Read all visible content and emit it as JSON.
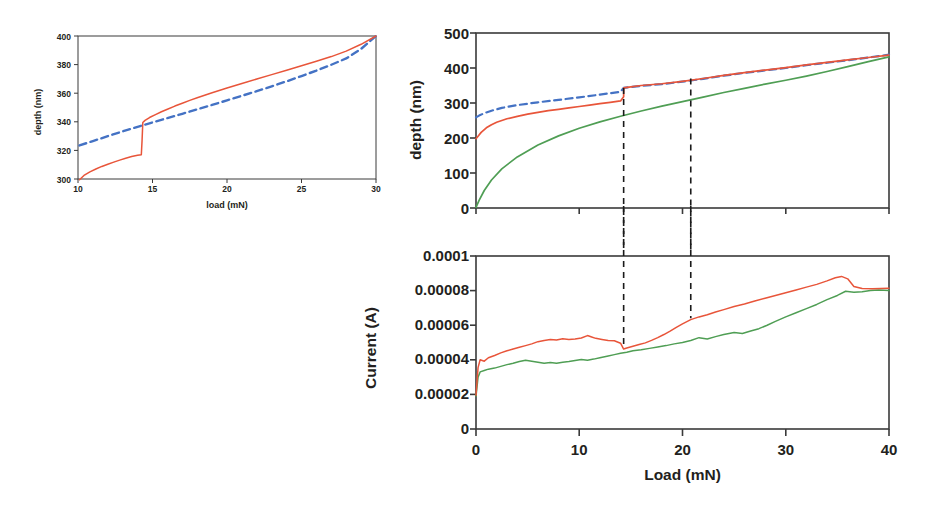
{
  "figure": {
    "title": "",
    "background": "#ffffff",
    "colors": {
      "red": "#e8553a",
      "green": "#4f9e54",
      "blue_dashed": "#4472c4",
      "axis": "#3a3a3a",
      "guide": "#1a1a1a",
      "text": "#231f20"
    }
  },
  "panels": {
    "left": {
      "name": "pop-in-detail",
      "xlabel": "load (mN)",
      "ylabel": "depth (nm)",
      "xticks": [
        "10",
        "15",
        "20",
        "25",
        "30"
      ],
      "yticks": [
        "300",
        "320",
        "340",
        "360",
        "380",
        "400"
      ]
    },
    "top_right": {
      "name": "depth-vs-load",
      "xlabel": "",
      "ylabel": "depth (nm)",
      "xticks": [
        "0",
        "10",
        "20",
        "30",
        "40"
      ],
      "yticks": [
        "0",
        "100",
        "200",
        "300",
        "400",
        "500"
      ]
    },
    "bottom_right": {
      "name": "current-vs-load",
      "xlabel": "Load (mN)",
      "ylabel": "Current (A)",
      "xticks": [
        "0",
        "10",
        "20",
        "30",
        "40"
      ],
      "yticks": [
        "0",
        "0.00002",
        "0.00004",
        "0.00006",
        "0.00008",
        "0.0001"
      ]
    }
  },
  "chart_data": [
    {
      "id": "left-panel",
      "type": "line",
      "title": "",
      "xlabel": "load (mN)",
      "ylabel": "depth (nm)",
      "xlim": [
        10,
        30
      ],
      "ylim": [
        300,
        400
      ],
      "xticks": [
        10,
        15,
        20,
        25,
        30
      ],
      "yticks": [
        300,
        320,
        340,
        360,
        380,
        400
      ],
      "grid": false,
      "legend": "none",
      "annotations": [
        "pop-in step at load 14.3 mN, depth jumps 317 to 340 nm"
      ],
      "series": [
        {
          "name": "loading curve (measured)",
          "color": "#e8553a",
          "style": "solid",
          "x": [
            10.1,
            10.4,
            10.8,
            11.2,
            11.6,
            12.0,
            12.4,
            12.8,
            13.2,
            13.6,
            14.0,
            14.25,
            14.3,
            14.35,
            14.5,
            14.8,
            15.2,
            15.6,
            16.0,
            16.5,
            17.0,
            17.5,
            18.0,
            18.5,
            19.0,
            20.0,
            21.0,
            22.0,
            23.0,
            24.0,
            25.0,
            26.0,
            27.0,
            28.0,
            29.0,
            30.0
          ],
          "y": [
            299.5,
            302.5,
            305.0,
            307.0,
            308.8,
            310.3,
            311.8,
            313.2,
            314.5,
            315.7,
            316.6,
            317.0,
            327.0,
            339.5,
            341.0,
            343.0,
            345.0,
            347.0,
            348.8,
            351.0,
            353.0,
            355.0,
            356.8,
            358.6,
            360.3,
            363.6,
            366.8,
            369.9,
            373.0,
            376.1,
            379.2,
            382.4,
            385.6,
            389.4,
            394.2,
            400.0
          ]
        },
        {
          "name": "reference/fit curve",
          "color": "#4472c4",
          "style": "dashed",
          "x": [
            10.1,
            11.0,
            12.0,
            13.0,
            14.0,
            15.0,
            16.0,
            17.0,
            18.0,
            19.0,
            20.0,
            21.0,
            22.0,
            23.0,
            24.0,
            25.0,
            26.0,
            27.0,
            28.0,
            29.0,
            30.0
          ],
          "y": [
            323.5,
            326.5,
            330.0,
            333.3,
            336.5,
            339.6,
            342.6,
            345.6,
            348.7,
            351.8,
            355.0,
            358.2,
            361.4,
            364.8,
            368.3,
            372.0,
            375.8,
            379.9,
            384.3,
            391.0,
            400.0
          ]
        }
      ]
    },
    {
      "id": "top-right-panel",
      "type": "line",
      "title": "",
      "xlabel": "",
      "ylabel": "depth (nm)",
      "xlim": [
        0,
        40
      ],
      "ylim": [
        0,
        500
      ],
      "xticks": [
        0,
        10,
        20,
        30,
        40
      ],
      "yticks": [
        0,
        100,
        200,
        300,
        400,
        500
      ],
      "grid": false,
      "legend": "none",
      "annotations": [
        "vertical dashed guide at 14.3 mN",
        "vertical dashed guide at 20.8 mN"
      ],
      "guides_x": [
        14.3,
        20.8
      ],
      "series": [
        {
          "name": "depth red (with pop-in)",
          "color": "#e8553a",
          "style": "solid",
          "x": [
            0.0,
            0.2,
            0.5,
            1.0,
            1.5,
            2.0,
            3.0,
            4.0,
            5.0,
            6.0,
            7.0,
            8.0,
            9.0,
            10.0,
            11.0,
            12.0,
            13.0,
            14.0,
            14.3,
            14.31,
            15.0,
            16.0,
            18.0,
            20.0,
            22.0,
            24.0,
            26.0,
            28.0,
            30.0,
            32.0,
            34.0,
            36.0,
            38.0,
            40.0
          ],
          "y": [
            198,
            205,
            216,
            229,
            238,
            245,
            255,
            262,
            268,
            273,
            278,
            282,
            286,
            290,
            294,
            298,
            302,
            306,
            318,
            343,
            346,
            350,
            355,
            362,
            370,
            379,
            387,
            394,
            401,
            409,
            416,
            423,
            430,
            437
          ]
        },
        {
          "name": "depth reference (dashed)",
          "color": "#4472c4",
          "style": "dashed",
          "x": [
            0.0,
            0.3,
            0.8,
            1.5,
            2.5,
            4.0,
            6.0,
            8.0,
            10.0,
            12.0,
            14.0,
            14.3,
            16.0,
            18.0,
            20.0,
            22.0,
            24.0,
            26.0,
            28.0,
            30.0,
            32.0,
            34.0,
            36.0,
            38.0,
            40.0
          ],
          "y": [
            259,
            264,
            271,
            278,
            286,
            294,
            302,
            309,
            316,
            324,
            332,
            343,
            349,
            354,
            361,
            369,
            378,
            386,
            393,
            400,
            408,
            415,
            422,
            430,
            438
          ]
        },
        {
          "name": "depth green (no pop-in)",
          "color": "#4f9e54",
          "style": "solid",
          "x": [
            0.0,
            0.3,
            0.8,
            1.5,
            2.5,
            4.0,
            6.0,
            8.0,
            10.0,
            12.0,
            14.0,
            16.0,
            18.0,
            20.0,
            22.0,
            24.0,
            26.0,
            28.0,
            30.0,
            32.0,
            34.0,
            36.0,
            38.0,
            40.0
          ],
          "y": [
            2,
            22,
            50,
            80,
            112,
            146,
            180,
            206,
            228,
            246,
            262,
            277,
            291,
            304,
            317,
            330,
            342,
            354,
            365,
            377,
            390,
            404,
            418,
            432
          ]
        }
      ]
    },
    {
      "id": "bottom-right-panel",
      "type": "line",
      "title": "",
      "xlabel": "Load (mN)",
      "ylabel": "Current (A)",
      "xlim": [
        0,
        40
      ],
      "ylim": [
        0,
        0.0001
      ],
      "xticks": [
        0,
        10,
        20,
        30,
        40
      ],
      "yticks": [
        0,
        2e-05,
        4e-05,
        6e-05,
        8e-05,
        0.0001
      ],
      "grid": false,
      "legend": "none",
      "annotations": [
        "vertical dashed guide at 14.3 mN aligned with pop-in",
        "vertical dashed guide at 20.8 mN",
        "red current dips at 14.3 mN then rises",
        "red peak 0.000088 near 35 mN"
      ],
      "guides_x": [
        14.3,
        20.8
      ],
      "series": [
        {
          "name": "current red",
          "color": "#e8553a",
          "style": "solid",
          "x": [
            0.0,
            0.2,
            0.4,
            0.8,
            1.2,
            1.8,
            2.4,
            3.0,
            3.6,
            4.2,
            4.8,
            5.4,
            6.0,
            6.6,
            7.2,
            7.8,
            8.4,
            9.0,
            9.6,
            10.2,
            10.8,
            11.2,
            11.6,
            12.2,
            12.8,
            13.4,
            14.0,
            14.3,
            14.6,
            15.2,
            15.8,
            16.4,
            17.0,
            17.6,
            18.2,
            18.8,
            19.4,
            20.0,
            20.8,
            21.6,
            22.4,
            23.2,
            24.0,
            25.0,
            26.0,
            27.0,
            28.0,
            29.0,
            30.0,
            31.0,
            32.0,
            33.0,
            34.0,
            34.8,
            35.4,
            36.0,
            36.6,
            37.4,
            38.4,
            39.2,
            40.0
          ],
          "y": [
            1.95e-05,
            3.55e-05,
            4e-05,
            3.92e-05,
            4.12e-05,
            4.25e-05,
            4.4e-05,
            4.52e-05,
            4.62e-05,
            4.72e-05,
            4.82e-05,
            4.92e-05,
            5.05e-05,
            5.12e-05,
            5.18e-05,
            5.15e-05,
            5.22e-05,
            5.18e-05,
            5.2e-05,
            5.26e-05,
            5.4e-05,
            5.32e-05,
            5.24e-05,
            5.18e-05,
            5.12e-05,
            5.1e-05,
            4.96e-05,
            4.62e-05,
            4.68e-05,
            4.78e-05,
            4.88e-05,
            4.98e-05,
            5.12e-05,
            5.28e-05,
            5.46e-05,
            5.66e-05,
            5.88e-05,
            6.08e-05,
            6.32e-05,
            6.48e-05,
            6.6e-05,
            6.76e-05,
            6.9e-05,
            7.08e-05,
            7.22e-05,
            7.4e-05,
            7.56e-05,
            7.72e-05,
            7.88e-05,
            8.04e-05,
            8.2e-05,
            8.36e-05,
            8.56e-05,
            8.74e-05,
            8.82e-05,
            8.68e-05,
            8.24e-05,
            8.12e-05,
            8.1e-05,
            8.12e-05,
            8.14e-05
          ]
        },
        {
          "name": "current green",
          "color": "#4f9e54",
          "style": "solid",
          "x": [
            0.0,
            0.2,
            0.4,
            0.8,
            1.2,
            1.8,
            2.4,
            3.0,
            3.6,
            4.2,
            4.8,
            5.4,
            6.0,
            6.6,
            7.2,
            7.8,
            8.4,
            9.0,
            9.6,
            10.2,
            10.8,
            11.4,
            12.0,
            12.8,
            13.4,
            14.0,
            14.6,
            15.2,
            16.0,
            16.8,
            17.6,
            18.4,
            19.2,
            20.0,
            20.8,
            21.6,
            22.4,
            23.2,
            24.0,
            25.0,
            25.8,
            26.6,
            27.4,
            28.2,
            29.0,
            30.0,
            31.0,
            32.0,
            33.0,
            34.0,
            35.0,
            35.8,
            36.6,
            37.4,
            38.2,
            39.0,
            40.0
          ],
          "y": [
            1.9e-05,
            3e-05,
            3.3e-05,
            3.38e-05,
            3.46e-05,
            3.52e-05,
            3.62e-05,
            3.72e-05,
            3.8e-05,
            3.9e-05,
            3.98e-05,
            3.92e-05,
            3.86e-05,
            3.8e-05,
            3.84e-05,
            3.8e-05,
            3.86e-05,
            3.9e-05,
            3.96e-05,
            4.02e-05,
            3.98e-05,
            4.04e-05,
            4.12e-05,
            4.22e-05,
            4.3e-05,
            4.38e-05,
            4.44e-05,
            4.52e-05,
            4.58e-05,
            4.66e-05,
            4.74e-05,
            4.82e-05,
            4.92e-05,
            5e-05,
            5.12e-05,
            5.28e-05,
            5.2e-05,
            5.34e-05,
            5.46e-05,
            5.58e-05,
            5.52e-05,
            5.66e-05,
            5.8e-05,
            6e-05,
            6.22e-05,
            6.48e-05,
            6.72e-05,
            6.96e-05,
            7.2e-05,
            7.48e-05,
            7.72e-05,
            7.96e-05,
            7.9e-05,
            7.94e-05,
            8e-05,
            8.04e-05,
            8e-05
          ]
        }
      ]
    }
  ]
}
